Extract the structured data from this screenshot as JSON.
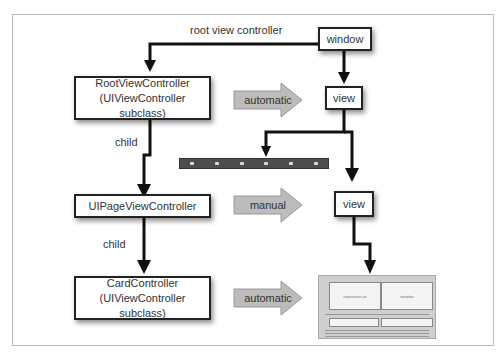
{
  "diagram": {
    "nodes": {
      "window": "window",
      "view_top": "view",
      "root_vc_line1": "RootViewController",
      "root_vc_line2": "(UIViewController subclass)",
      "page_vc": "UIPageViewController",
      "view_mid": "view",
      "card_vc_line1": "CardController",
      "card_vc_line2": "(UIViewController subclass)"
    },
    "edge_labels": {
      "root": "root view controller",
      "child1": "child",
      "child2": "child"
    },
    "transition_arrows": [
      "automatic",
      "manual",
      "automatic"
    ],
    "card_preview": {
      "left_pane": "expansion as",
      "right_pane": "window"
    },
    "colors": {
      "line": "#111111",
      "arrow_fill": "#bcbcbc",
      "toolbar": "#4d4d4d"
    }
  }
}
